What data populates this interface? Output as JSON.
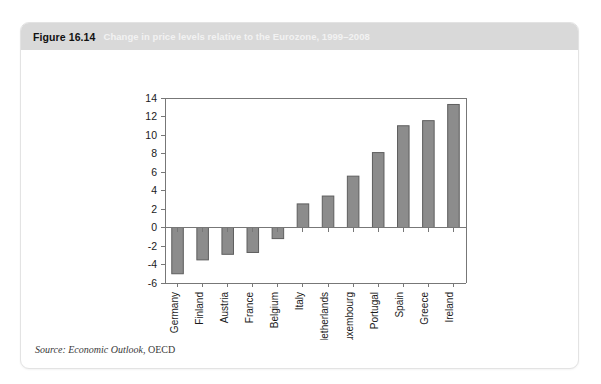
{
  "figure": {
    "number": "Figure 16.14",
    "caption": "Change in price levels relative to the Eurozone, 1999–2008",
    "source_prefix": "Source: Economic Outlook,",
    "source_suffix": "OECD"
  },
  "colors": {
    "header_band": "#d9d9d9",
    "figure_number_text": "#111111",
    "caption_text": "#f2f2f2",
    "bar_fill": "#8c8c8c",
    "bar_stroke": "#5e5e5e",
    "axis": "#777777",
    "card_border": "#e3e3e3"
  },
  "chart_data": {
    "type": "bar",
    "title": "Change in price levels relative to the Eurozone, 1999–2008",
    "xlabel": "",
    "ylabel": "",
    "categories": [
      "Germany",
      "Finland",
      "Austria",
      "France",
      "Belgium",
      "Italy",
      "Netherlands",
      "Luxembourg",
      "Portugal",
      "Spain",
      "Greece",
      "Ireland"
    ],
    "values": [
      -5.0,
      -3.5,
      -2.9,
      -2.7,
      -1.2,
      2.55,
      3.4,
      5.55,
      8.1,
      11.0,
      11.55,
      13.3
    ],
    "ylim": [
      -6,
      14
    ],
    "yticks": [
      -6,
      -4,
      -2,
      0,
      2,
      4,
      6,
      8,
      10,
      12,
      14
    ],
    "ytick_labels": [
      "-6",
      "-4",
      "-2",
      "0",
      "2",
      "4",
      "6",
      "8",
      "10",
      "12",
      "14"
    ],
    "grid": false,
    "legend": null,
    "zero_line": 0
  }
}
